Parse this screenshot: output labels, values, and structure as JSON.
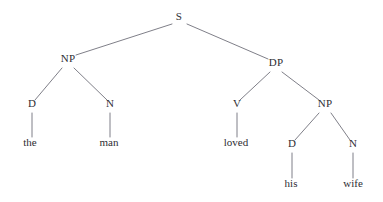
{
  "figure": {
    "type": "constituency-syntax-tree",
    "sentence": "the man loved his wife",
    "width": 383,
    "height": 202,
    "background_color": "#ffffff",
    "edge_color": "#70707a",
    "text_color": "#2e2e33"
  },
  "nodes": [
    {
      "id": "s",
      "label": "S",
      "x": 179,
      "y": 20,
      "kind": "category"
    },
    {
      "id": "np1",
      "label": "NP",
      "x": 68,
      "y": 62,
      "kind": "category"
    },
    {
      "id": "d1",
      "label": "D",
      "x": 32,
      "y": 107,
      "kind": "category"
    },
    {
      "id": "n1",
      "label": "N",
      "x": 110,
      "y": 107,
      "kind": "category"
    },
    {
      "id": "dp",
      "label": "DP",
      "x": 276,
      "y": 66,
      "kind": "category"
    },
    {
      "id": "v",
      "label": "V",
      "x": 237,
      "y": 107,
      "kind": "category"
    },
    {
      "id": "np2",
      "label": "NP",
      "x": 325,
      "y": 107,
      "kind": "category"
    },
    {
      "id": "d2",
      "label": "D",
      "x": 292,
      "y": 147,
      "kind": "category"
    },
    {
      "id": "n2",
      "label": "N",
      "x": 353,
      "y": 147,
      "kind": "category"
    },
    {
      "id": "leaf_the",
      "label": "the",
      "x": 30,
      "y": 146,
      "kind": "terminal"
    },
    {
      "id": "leaf_man",
      "label": "man",
      "x": 109,
      "y": 146,
      "kind": "terminal"
    },
    {
      "id": "leaf_loved",
      "label": "loved",
      "x": 236,
      "y": 146,
      "kind": "terminal"
    },
    {
      "id": "leaf_his",
      "label": "his",
      "x": 291,
      "y": 187,
      "kind": "terminal"
    },
    {
      "id": "leaf_wife",
      "label": "wife",
      "x": 353,
      "y": 187,
      "kind": "terminal"
    }
  ],
  "edges": [
    {
      "id": "e_s_np1",
      "from": "S",
      "to": "NP",
      "x1": 172,
      "y1": 24,
      "x2": 76,
      "y2": 55
    },
    {
      "id": "e_s_dp",
      "from": "S",
      "to": "DP",
      "x1": 187,
      "y1": 24,
      "x2": 268,
      "y2": 59
    },
    {
      "id": "e_np1_d1",
      "from": "NP",
      "to": "D",
      "x1": 62,
      "y1": 68,
      "x2": 35,
      "y2": 100
    },
    {
      "id": "e_np1_n1",
      "from": "NP",
      "to": "N",
      "x1": 74,
      "y1": 68,
      "x2": 107,
      "y2": 100
    },
    {
      "id": "e_dp_v",
      "from": "DP",
      "to": "V",
      "x1": 270,
      "y1": 72,
      "x2": 240,
      "y2": 100
    },
    {
      "id": "e_dp_np2",
      "from": "DP",
      "to": "NP",
      "x1": 282,
      "y1": 72,
      "x2": 319,
      "y2": 100
    },
    {
      "id": "e_np2_d2",
      "from": "NP",
      "to": "D",
      "x1": 319,
      "y1": 113,
      "x2": 295,
      "y2": 140
    },
    {
      "id": "e_np2_n2",
      "from": "NP",
      "to": "N",
      "x1": 331,
      "y1": 113,
      "x2": 350,
      "y2": 140
    },
    {
      "id": "e_d1_the",
      "from": "D",
      "to": "the",
      "x1": 32,
      "y1": 113,
      "x2": 32,
      "y2": 137
    },
    {
      "id": "e_n1_man",
      "from": "N",
      "to": "man",
      "x1": 110,
      "y1": 113,
      "x2": 110,
      "y2": 137
    },
    {
      "id": "e_v_loved",
      "from": "V",
      "to": "loved",
      "x1": 237,
      "y1": 113,
      "x2": 237,
      "y2": 137
    },
    {
      "id": "e_d2_his",
      "from": "D",
      "to": "his",
      "x1": 292,
      "y1": 153,
      "x2": 292,
      "y2": 178
    },
    {
      "id": "e_n2_wife",
      "from": "N",
      "to": "wife",
      "x1": 353,
      "y1": 153,
      "x2": 353,
      "y2": 178
    }
  ]
}
